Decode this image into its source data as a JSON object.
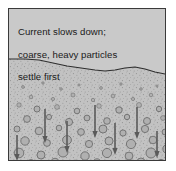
{
  "figure": {
    "type": "geology-sedimentation-diagram",
    "caption_lines": [
      "Current slows down;",
      "coarse, heavy particles",
      "settle first"
    ],
    "colors": {
      "page_background": "#ffffff",
      "panel_background": "#c9c9c9",
      "panel_border": "#3a3a3a",
      "water_fill": "#c9c9c9",
      "sediment_fill": "#c2c2c2",
      "particle_fill": "#b0b0b0",
      "particle_stroke": "#6d6d6d",
      "speckle": "#8f8f8f",
      "arrow": "#5a5a5a",
      "boundary_line": "#2e2e2e",
      "text": "#1a1a1a"
    },
    "sediment_boundary": {
      "label": "wavy sediment surface line",
      "points": "0,50 16,50 30,51 44,54 58,57 72,59 86,61 96,62 106,61 116,59 126,58 136,60 146,63 156,65"
    },
    "arrows": {
      "label": "settling particle direction arrows",
      "direction": "down",
      "count": 7,
      "items": [
        {
          "x": 36,
          "y_top": 100,
          "y_tip": 134
        },
        {
          "x": 58,
          "y_top": 112,
          "y_tip": 144
        },
        {
          "x": 86,
          "y_top": 96,
          "y_tip": 129
        },
        {
          "x": 106,
          "y_top": 114,
          "y_tip": 146
        },
        {
          "x": 128,
          "y_top": 98,
          "y_tip": 130
        },
        {
          "x": 8,
          "y_top": 126,
          "y_tip": 152
        },
        {
          "x": 148,
          "y_top": 122,
          "y_tip": 149
        }
      ]
    },
    "particles": {
      "label": "settling grains, coarser toward the bottom",
      "items": [
        {
          "cx": 14,
          "cy": 78,
          "r": 1.4
        },
        {
          "cx": 34,
          "cy": 74,
          "r": 1.2
        },
        {
          "cx": 52,
          "cy": 80,
          "r": 1.3
        },
        {
          "cx": 70,
          "cy": 76,
          "r": 1.1
        },
        {
          "cx": 92,
          "cy": 79,
          "r": 1.4
        },
        {
          "cx": 112,
          "cy": 75,
          "r": 1.2
        },
        {
          "cx": 132,
          "cy": 80,
          "r": 1.3
        },
        {
          "cx": 148,
          "cy": 77,
          "r": 1.1
        },
        {
          "cx": 22,
          "cy": 88,
          "r": 1.8
        },
        {
          "cx": 44,
          "cy": 90,
          "r": 1.6
        },
        {
          "cx": 64,
          "cy": 86,
          "r": 2.0
        },
        {
          "cx": 84,
          "cy": 91,
          "r": 1.7
        },
        {
          "cx": 104,
          "cy": 87,
          "r": 1.9
        },
        {
          "cx": 124,
          "cy": 90,
          "r": 1.6
        },
        {
          "cx": 142,
          "cy": 86,
          "r": 1.8
        },
        {
          "cx": 10,
          "cy": 96,
          "r": 2.2
        },
        {
          "cx": 28,
          "cy": 100,
          "r": 3.0
        },
        {
          "cx": 48,
          "cy": 98,
          "r": 2.4
        },
        {
          "cx": 68,
          "cy": 102,
          "r": 2.8
        },
        {
          "cx": 90,
          "cy": 97,
          "r": 2.3
        },
        {
          "cx": 110,
          "cy": 101,
          "r": 3.2
        },
        {
          "cx": 130,
          "cy": 96,
          "r": 2.5
        },
        {
          "cx": 150,
          "cy": 100,
          "r": 2.7
        },
        {
          "cx": 18,
          "cy": 110,
          "r": 3.4
        },
        {
          "cx": 40,
          "cy": 108,
          "r": 2.6
        },
        {
          "cx": 60,
          "cy": 113,
          "r": 3.6
        },
        {
          "cx": 78,
          "cy": 109,
          "r": 2.9
        },
        {
          "cx": 98,
          "cy": 112,
          "r": 3.3
        },
        {
          "cx": 118,
          "cy": 108,
          "r": 2.7
        },
        {
          "cx": 138,
          "cy": 112,
          "r": 3.5
        },
        {
          "cx": 154,
          "cy": 109,
          "r": 2.4
        },
        {
          "cx": 8,
          "cy": 120,
          "r": 3.0
        },
        {
          "cx": 30,
          "cy": 122,
          "r": 3.8
        },
        {
          "cx": 50,
          "cy": 119,
          "r": 2.8
        },
        {
          "cx": 72,
          "cy": 123,
          "r": 3.4
        },
        {
          "cx": 94,
          "cy": 120,
          "r": 4.0
        },
        {
          "cx": 114,
          "cy": 124,
          "r": 3.1
        },
        {
          "cx": 136,
          "cy": 120,
          "r": 3.6
        },
        {
          "cx": 156,
          "cy": 123,
          "r": 2.9
        },
        {
          "cx": 16,
          "cy": 132,
          "r": 4.2
        },
        {
          "cx": 38,
          "cy": 134,
          "r": 3.4
        },
        {
          "cx": 58,
          "cy": 131,
          "r": 4.4
        },
        {
          "cx": 80,
          "cy": 135,
          "r": 3.6
        },
        {
          "cx": 100,
          "cy": 132,
          "r": 4.0
        },
        {
          "cx": 122,
          "cy": 135,
          "r": 4.6
        },
        {
          "cx": 144,
          "cy": 131,
          "r": 3.8
        },
        {
          "cx": 10,
          "cy": 144,
          "r": 4.8
        },
        {
          "cx": 32,
          "cy": 146,
          "r": 4.0
        },
        {
          "cx": 54,
          "cy": 143,
          "r": 5.0
        },
        {
          "cx": 76,
          "cy": 147,
          "r": 4.2
        },
        {
          "cx": 98,
          "cy": 144,
          "r": 4.6
        },
        {
          "cx": 120,
          "cy": 147,
          "r": 3.9
        },
        {
          "cx": 142,
          "cy": 144,
          "r": 5.0
        },
        {
          "cx": 158,
          "cy": 140,
          "r": 4.1
        },
        {
          "cx": 22,
          "cy": 155,
          "r": 4.4
        },
        {
          "cx": 46,
          "cy": 153,
          "r": 3.8
        },
        {
          "cx": 66,
          "cy": 156,
          "r": 4.8
        },
        {
          "cx": 88,
          "cy": 154,
          "r": 4.2
        },
        {
          "cx": 110,
          "cy": 156,
          "r": 4.5
        },
        {
          "cx": 132,
          "cy": 153,
          "r": 4.0
        },
        {
          "cx": 152,
          "cy": 155,
          "r": 4.6
        }
      ]
    }
  }
}
